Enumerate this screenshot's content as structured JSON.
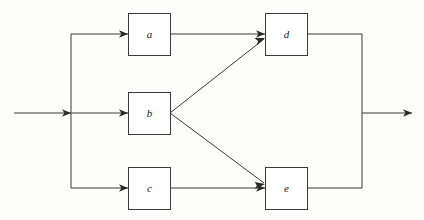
{
  "diagram": {
    "type": "block-flow-diagram",
    "background_color": "#fdfdfb",
    "line_color": "#3a3a3a",
    "label_color": "#1a1a1a",
    "block_fill": "#ffffff",
    "blocks": [
      {
        "id": "a",
        "label": "a",
        "x": 128,
        "y": 13,
        "width": 42,
        "height": 42,
        "cx": 149,
        "cy": 34
      },
      {
        "id": "b",
        "label": "b",
        "x": 128,
        "y": 92,
        "width": 42,
        "height": 42,
        "cx": 149,
        "cy": 113
      },
      {
        "id": "c",
        "label": "c",
        "x": 128,
        "y": 167,
        "width": 42,
        "height": 42,
        "cx": 149,
        "cy": 188
      },
      {
        "id": "d",
        "label": "d",
        "x": 265,
        "y": 13,
        "width": 42,
        "height": 42,
        "cx": 286,
        "cy": 34
      },
      {
        "id": "e",
        "label": "e",
        "x": 265,
        "y": 167,
        "width": 42,
        "height": 42,
        "cx": 286,
        "cy": 188
      }
    ],
    "connections": [
      {
        "id": "input-main",
        "from": "input",
        "to": "split-bus",
        "kind": "arrow",
        "x1": 14,
        "y1": 113,
        "x2": 71,
        "y2": 113
      },
      {
        "id": "split-bus-vertical",
        "from": "split-bus-top",
        "to": "split-bus-bottom",
        "kind": "line",
        "x1": 71,
        "y1": 34,
        "x2": 71,
        "y2": 188
      },
      {
        "id": "bus-to-a",
        "from": "split-bus",
        "to": "a",
        "kind": "arrow",
        "x1": 71,
        "y1": 34,
        "x2": 128,
        "y2": 34
      },
      {
        "id": "bus-to-b",
        "from": "split-bus",
        "to": "b",
        "kind": "arrow",
        "x1": 71,
        "y1": 113,
        "x2": 128,
        "y2": 113
      },
      {
        "id": "bus-to-c",
        "from": "split-bus",
        "to": "c",
        "kind": "arrow",
        "x1": 71,
        "y1": 188,
        "x2": 128,
        "y2": 188
      },
      {
        "id": "a-to-d",
        "from": "a",
        "to": "d",
        "kind": "arrow",
        "x1": 170,
        "y1": 34,
        "x2": 265,
        "y2": 34
      },
      {
        "id": "b-to-d",
        "from": "b",
        "to": "d",
        "kind": "arrow",
        "x1": 170,
        "y1": 113,
        "x2": 265,
        "y2": 38
      },
      {
        "id": "b-to-e",
        "from": "b",
        "to": "e",
        "kind": "arrow",
        "x1": 170,
        "y1": 113,
        "x2": 265,
        "y2": 184
      },
      {
        "id": "c-to-e",
        "from": "c",
        "to": "e",
        "kind": "arrow",
        "x1": 170,
        "y1": 188,
        "x2": 265,
        "y2": 188
      },
      {
        "id": "d-to-merge",
        "from": "d",
        "to": "merge-bus",
        "kind": "line",
        "x1": 307,
        "y1": 34,
        "x2": 362,
        "y2": 34
      },
      {
        "id": "e-to-merge",
        "from": "e",
        "to": "merge-bus",
        "kind": "line",
        "x1": 307,
        "y1": 188,
        "x2": 362,
        "y2": 188
      },
      {
        "id": "merge-bus-vertical",
        "from": "merge-bus-top",
        "to": "merge-bus-bottom",
        "kind": "line",
        "x1": 362,
        "y1": 34,
        "x2": 362,
        "y2": 188
      },
      {
        "id": "output-main",
        "from": "merge-bus",
        "to": "output",
        "kind": "arrow",
        "x1": 362,
        "y1": 113,
        "x2": 412,
        "y2": 113
      }
    ]
  }
}
